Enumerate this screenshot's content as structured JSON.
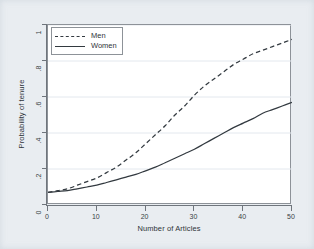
{
  "figure": {
    "background_color": "#e9edf1",
    "plot_background_color": "#ffffff",
    "frame_color": "#8d9298",
    "line_color": "#333a40"
  },
  "chart_data": {
    "type": "line",
    "title": "",
    "subtitle": "",
    "xlabel": "Number of Articles",
    "ylabel": "Probability of tenure",
    "xlim": [
      0,
      50
    ],
    "ylim": [
      0,
      1
    ],
    "xticks": [
      0,
      10,
      20,
      30,
      40,
      50
    ],
    "xtick_labels": [
      "0",
      "10",
      "20",
      "30",
      "40",
      "50"
    ],
    "yticks": [
      0,
      0.2,
      0.4,
      0.6,
      0.8,
      1
    ],
    "ytick_labels": [
      "0",
      ".2",
      ".4",
      ".6",
      ".8",
      "1"
    ],
    "grid": "horizontal-faint",
    "legend_position": "top-left-inside",
    "x": [
      0,
      2,
      4,
      6,
      8,
      10,
      12,
      14,
      16,
      18,
      20,
      22,
      24,
      26,
      28,
      30,
      32,
      34,
      36,
      38,
      40,
      42,
      44,
      46,
      48,
      50
    ],
    "series": [
      {
        "name": "Men",
        "style": "dashed",
        "color": "#333a40",
        "values": [
          0.07,
          0.08,
          0.09,
          0.11,
          0.13,
          0.15,
          0.18,
          0.21,
          0.25,
          0.29,
          0.34,
          0.39,
          0.44,
          0.5,
          0.55,
          0.61,
          0.66,
          0.7,
          0.74,
          0.78,
          0.81,
          0.84,
          0.86,
          0.88,
          0.9,
          0.92
        ]
      },
      {
        "name": "Women",
        "style": "solid",
        "color": "#333a40",
        "values": [
          0.07,
          0.075,
          0.08,
          0.09,
          0.1,
          0.11,
          0.125,
          0.14,
          0.155,
          0.17,
          0.19,
          0.21,
          0.235,
          0.26,
          0.285,
          0.31,
          0.34,
          0.37,
          0.4,
          0.43,
          0.455,
          0.48,
          0.51,
          0.53,
          0.55,
          0.57
        ]
      }
    ]
  },
  "legend": {
    "entries": [
      {
        "label": "Men",
        "style": "dashed"
      },
      {
        "label": "Women",
        "style": "solid"
      }
    ]
  }
}
